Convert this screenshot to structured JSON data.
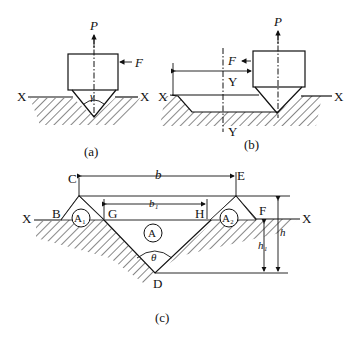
{
  "figure": {
    "panels": [
      {
        "id": "a",
        "caption": "(a)",
        "labels": {
          "force_vertical": "P",
          "force_horizontal": "F",
          "axis_left": "X",
          "axis_right": "X",
          "angle": "γ"
        }
      },
      {
        "id": "b",
        "caption": "(b)",
        "labels": {
          "force_vertical": "P",
          "force_horizontal": "F",
          "axis_left": "X",
          "axis_right": "X",
          "section_top": "Y",
          "section_bottom": "Y"
        }
      },
      {
        "id": "c",
        "caption": "(c)",
        "labels": {
          "axis_left": "X",
          "axis_right": "X",
          "point_b": "B",
          "point_c": "C",
          "point_d": "D",
          "point_e": "E",
          "point_f": "F",
          "point_g": "G",
          "point_h": "H",
          "area_a": "A",
          "area_a1": "A₁",
          "area_a2": "A₂",
          "width_b": "b",
          "width_b1": "b₁",
          "height_h": "h",
          "height_h1": "h₁",
          "angle": "θ"
        }
      }
    ]
  }
}
